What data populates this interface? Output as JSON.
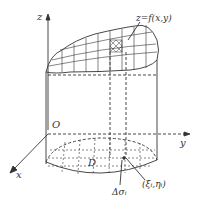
{
  "diagram": {
    "labels": {
      "z_axis": "z",
      "y_axis": "y",
      "x_axis": "x",
      "origin": "O",
      "surface": "z=f(x,y)",
      "region": "D",
      "area_element": "Δσᵢ",
      "point": "(ξᵢ,ηᵢ)"
    },
    "colors": {
      "stroke": "#333333",
      "background": "#ffffff"
    }
  }
}
